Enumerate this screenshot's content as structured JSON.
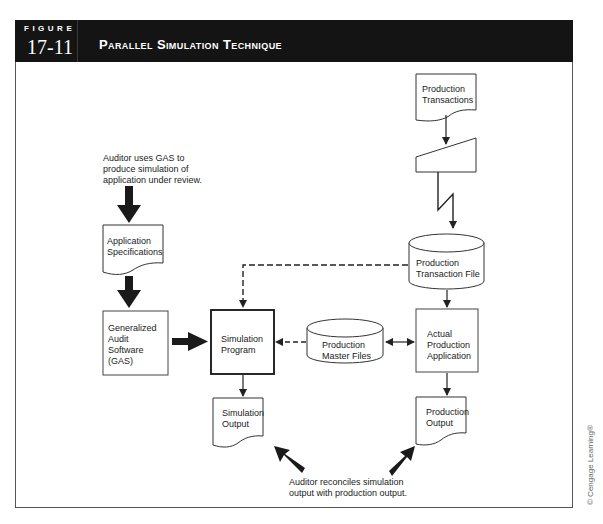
{
  "figure": {
    "label": "FIGURE",
    "number": "17-11",
    "title": "Parallel Simulation Technique"
  },
  "nodes": {
    "auditor_note": "Auditor uses GAS to\nproduce simulation of\napplication under review.",
    "application_specifications": "Application\nSpecifications",
    "generalized_audit_software": "Generalized\nAudit\nSoftware\n(GAS)",
    "simulation_program": "Simulation\nProgram",
    "simulation_output": "Simulation\nOutput",
    "production_transactions": "Production\nTransactions",
    "production_transaction_file": "Production\nTransaction File",
    "production_master_files": "Production\nMaster Files",
    "actual_production_application": "Actual\nProduction\nApplication",
    "production_output": "Production\nOutput",
    "reconcile_note": "Auditor reconciles simulation\noutput with production output."
  },
  "edges": [
    {
      "from": "auditor_note",
      "to": "application_specifications",
      "style": "thick"
    },
    {
      "from": "application_specifications",
      "to": "generalized_audit_software",
      "style": "thick"
    },
    {
      "from": "generalized_audit_software",
      "to": "simulation_program",
      "style": "thick"
    },
    {
      "from": "production_transactions",
      "to": "manual_input",
      "style": "solid"
    },
    {
      "from": "manual_input",
      "to": "production_transaction_file",
      "style": "communication-link"
    },
    {
      "from": "production_transaction_file",
      "to": "simulation_program",
      "style": "dashed"
    },
    {
      "from": "production_transaction_file",
      "to": "actual_production_application",
      "style": "solid"
    },
    {
      "from": "production_master_files",
      "to": "simulation_program",
      "style": "dashed"
    },
    {
      "from": "production_master_files",
      "to": "actual_production_application",
      "style": "bidirectional"
    },
    {
      "from": "simulation_program",
      "to": "simulation_output",
      "style": "solid"
    },
    {
      "from": "actual_production_application",
      "to": "production_output",
      "style": "solid"
    },
    {
      "from": "reconcile_note",
      "to": "simulation_output",
      "style": "thick"
    },
    {
      "from": "reconcile_note",
      "to": "production_output",
      "style": "thick"
    }
  ],
  "copyright": "© Cengage Learning®",
  "colors": {
    "header_bg": "#141414",
    "stroke": "#222222",
    "frame": "#555555"
  }
}
